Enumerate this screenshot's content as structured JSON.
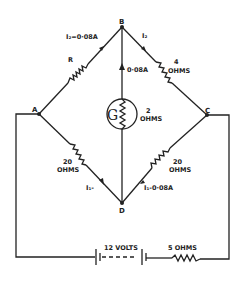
{
  "diagram": {
    "type": "wheatstone-bridge-circuit",
    "nodes": {
      "A": "A",
      "B": "B",
      "C": "C",
      "D": "D"
    },
    "branches": {
      "AB": {
        "resistor": "R",
        "current": "I₂=0·08A"
      },
      "BC": {
        "resistor_value": "4",
        "resistor_unit": "OHMS",
        "current": "I₂"
      },
      "BD": {
        "current": "0·08A",
        "galvanometer_symbol": "G",
        "galvanometer_value": "2",
        "galvanometer_unit": "OHMS"
      },
      "AD": {
        "resistor_value": "20",
        "resistor_unit": "OHMS",
        "current": "I₁-"
      },
      "DC": {
        "resistor_value": "20",
        "resistor_unit": "OHMS",
        "current": "I₁-0·08A"
      }
    },
    "supply": {
      "battery_label": "12 VOLTS",
      "series_resistor_label": "5 OHMS"
    }
  }
}
